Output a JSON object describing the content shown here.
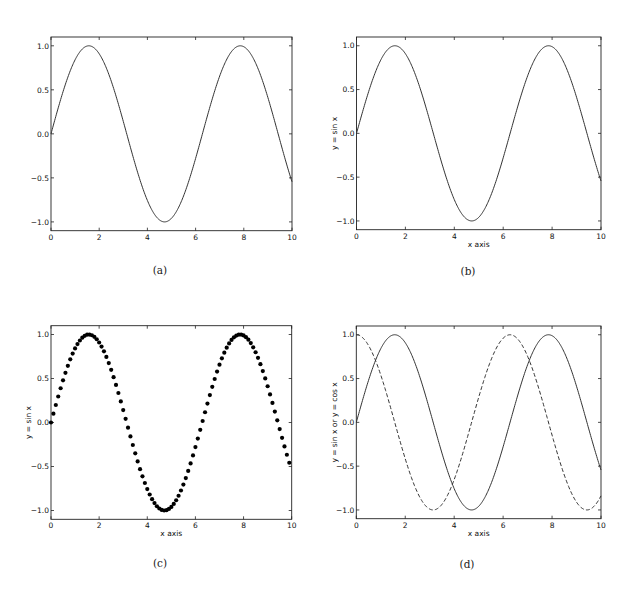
{
  "figure": {
    "panels": [
      {
        "id": "a",
        "caption": "(a)",
        "xlabel": "",
        "ylabel": "",
        "style": "line"
      },
      {
        "id": "b",
        "caption": "(b)",
        "xlabel": "x axis",
        "ylabel": "y = sin x",
        "style": "line"
      },
      {
        "id": "c",
        "caption": "(c)",
        "xlabel": "x axis",
        "ylabel": "y = sin x",
        "style": "dots"
      },
      {
        "id": "d",
        "caption": "(d)",
        "xlabel": "x axis",
        "ylabel": "y = sin x  or  y = cos x",
        "style": "line+dashed"
      }
    ],
    "xticks": [
      "0",
      "2",
      "4",
      "6",
      "8",
      "10"
    ],
    "yticks": [
      "1.0",
      "0.5",
      "0.0",
      "−0.5",
      "−1.0"
    ]
  },
  "chart_data": [
    {
      "type": "line",
      "title": "",
      "caption": "(a)",
      "xlabel": "",
      "ylabel": "",
      "xlim": [
        0,
        10
      ],
      "ylim": [
        -1.1,
        1.1
      ],
      "xticks": [
        0,
        2,
        4,
        6,
        8,
        10
      ],
      "yticks": [
        -1.0,
        -0.5,
        0.0,
        0.5,
        1.0
      ],
      "grid": false,
      "series": [
        {
          "name": "sin x",
          "function": "sin(x)",
          "style": "solid",
          "x": [
            0,
            0.5,
            1,
            1.5,
            2,
            2.5,
            3,
            3.5,
            4,
            4.5,
            5,
            5.5,
            6,
            6.5,
            7,
            7.5,
            8,
            8.5,
            9,
            9.5,
            10
          ],
          "y": [
            0,
            0.479,
            0.841,
            0.997,
            0.909,
            0.598,
            0.141,
            -0.351,
            -0.757,
            -0.978,
            -0.959,
            -0.706,
            -0.279,
            0.215,
            0.657,
            0.938,
            0.989,
            0.798,
            0.412,
            -0.075,
            -0.544
          ]
        }
      ]
    },
    {
      "type": "line",
      "title": "",
      "caption": "(b)",
      "xlabel": "x axis",
      "ylabel": "y = sin x",
      "xlim": [
        0,
        10
      ],
      "ylim": [
        -1.1,
        1.1
      ],
      "xticks": [
        0,
        2,
        4,
        6,
        8,
        10
      ],
      "yticks": [
        -1.0,
        -0.5,
        0.0,
        0.5,
        1.0
      ],
      "grid": false,
      "series": [
        {
          "name": "sin x",
          "function": "sin(x)",
          "style": "solid",
          "x": [
            0,
            0.5,
            1,
            1.5,
            2,
            2.5,
            3,
            3.5,
            4,
            4.5,
            5,
            5.5,
            6,
            6.5,
            7,
            7.5,
            8,
            8.5,
            9,
            9.5,
            10
          ],
          "y": [
            0,
            0.479,
            0.841,
            0.997,
            0.909,
            0.598,
            0.141,
            -0.351,
            -0.757,
            -0.978,
            -0.959,
            -0.706,
            -0.279,
            0.215,
            0.657,
            0.938,
            0.989,
            0.798,
            0.412,
            -0.075,
            -0.544
          ]
        }
      ]
    },
    {
      "type": "scatter",
      "title": "",
      "caption": "(c)",
      "xlabel": "x axis",
      "ylabel": "y = sin x",
      "xlim": [
        0,
        10
      ],
      "ylim": [
        -1.1,
        1.1
      ],
      "xticks": [
        0,
        2,
        4,
        6,
        8,
        10
      ],
      "yticks": [
        -1.0,
        -0.5,
        0.0,
        0.5,
        1.0
      ],
      "grid": false,
      "series": [
        {
          "name": "sin x",
          "function": "sin(x)",
          "style": "dots",
          "x_start": 0,
          "x_step": 0.1,
          "n_points": 100
        }
      ]
    },
    {
      "type": "line",
      "title": "",
      "caption": "(d)",
      "xlabel": "x axis",
      "ylabel": "y = sin x  or  y = cos x",
      "xlim": [
        0,
        10
      ],
      "ylim": [
        -1.1,
        1.1
      ],
      "xticks": [
        0,
        2,
        4,
        6,
        8,
        10
      ],
      "yticks": [
        -1.0,
        -0.5,
        0.0,
        0.5,
        1.0
      ],
      "grid": false,
      "series": [
        {
          "name": "sin x",
          "function": "sin(x)",
          "style": "solid",
          "x": [
            0,
            0.5,
            1,
            1.5,
            2,
            2.5,
            3,
            3.5,
            4,
            4.5,
            5,
            5.5,
            6,
            6.5,
            7,
            7.5,
            8,
            8.5,
            9,
            9.5,
            10
          ],
          "y": [
            0,
            0.479,
            0.841,
            0.997,
            0.909,
            0.598,
            0.141,
            -0.351,
            -0.757,
            -0.978,
            -0.959,
            -0.706,
            -0.279,
            0.215,
            0.657,
            0.938,
            0.989,
            0.798,
            0.412,
            -0.075,
            -0.544
          ]
        },
        {
          "name": "cos x",
          "function": "cos(x)",
          "style": "dashed",
          "x": [
            0,
            0.5,
            1,
            1.5,
            2,
            2.5,
            3,
            3.5,
            4,
            4.5,
            5,
            5.5,
            6,
            6.5,
            7,
            7.5,
            8,
            8.5,
            9,
            9.5,
            10
          ],
          "y": [
            1,
            0.878,
            0.54,
            0.071,
            -0.416,
            -0.801,
            -0.99,
            -0.936,
            -0.654,
            -0.211,
            0.284,
            0.709,
            0.96,
            0.977,
            0.754,
            0.347,
            -0.146,
            -0.602,
            -0.911,
            -0.997,
            -0.839
          ]
        }
      ]
    }
  ]
}
